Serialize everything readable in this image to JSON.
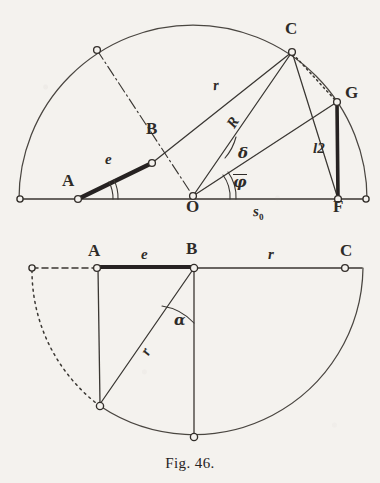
{
  "figure": {
    "caption": "Fig. 46.",
    "ink_color": "#3a3733",
    "paper_color": "#f4f2ee",
    "heavy_ink_color": "#262320"
  },
  "upper_diagram": {
    "name": "crank-slider-geometry-upper",
    "points": [
      {
        "id": "A",
        "label": "A",
        "x": 78,
        "y": 199
      },
      {
        "id": "B",
        "label": "B",
        "x": 152,
        "y": 163
      },
      {
        "id": "C",
        "label": "C",
        "x": 292,
        "y": 52
      },
      {
        "id": "O",
        "label": "O",
        "x": 193,
        "y": 196
      },
      {
        "id": "F",
        "label": "F",
        "x": 338,
        "y": 199
      },
      {
        "id": "G",
        "label": "G",
        "x": 337,
        "y": 102
      }
    ],
    "labels": [
      {
        "id": "A",
        "text": "A",
        "kind": "point",
        "x": 62,
        "y": 172
      },
      {
        "id": "B",
        "text": "B",
        "kind": "point",
        "x": 146,
        "y": 120
      },
      {
        "id": "C",
        "text": "C",
        "kind": "point",
        "x": 285,
        "y": 20
      },
      {
        "id": "O",
        "text": "O",
        "kind": "point",
        "x": 186,
        "y": 198
      },
      {
        "id": "F",
        "text": "F",
        "kind": "point",
        "x": 333,
        "y": 198
      },
      {
        "id": "G",
        "text": "G",
        "kind": "point",
        "x": 345,
        "y": 84
      },
      {
        "id": "e",
        "text": "e",
        "kind": "var",
        "x": 105,
        "y": 152
      },
      {
        "id": "r",
        "text": "r",
        "kind": "var",
        "x": 213,
        "y": 78
      },
      {
        "id": "R",
        "text": "R",
        "kind": "var",
        "x": 228,
        "y": 115
      },
      {
        "id": "l2",
        "text": "l2",
        "kind": "var",
        "x": 313,
        "y": 141
      }
    ],
    "greek_labels": [
      {
        "id": "delta",
        "text": "δ",
        "x": 238,
        "y": 146
      },
      {
        "id": "phibar",
        "text": "φ",
        "overbar": true,
        "x": 233,
        "y": 174
      }
    ],
    "sub_labels": [
      {
        "id": "s0",
        "text": "s",
        "sub": "0",
        "x": 253,
        "y": 204
      }
    ],
    "baseline": {
      "x1": 20,
      "y1": 199,
      "x2": 366,
      "y2": 199
    },
    "arc": {
      "center_x": 193,
      "center_y": 199,
      "radius": 174
    },
    "angle_arcs": [
      {
        "id": "angle-at-A",
        "vertex": "A",
        "style": "double"
      },
      {
        "id": "angle-delta",
        "vertex": "O",
        "style": "single"
      },
      {
        "id": "angle-phibar",
        "vertex": "O",
        "style": "double"
      }
    ],
    "segments": [
      {
        "id": "seg-AB",
        "from": "A",
        "to": "B",
        "style": "heavy"
      },
      {
        "id": "seg-BC",
        "from": "B",
        "to": "C",
        "style": "thin"
      },
      {
        "id": "seg-OC",
        "from": "O",
        "to": "C",
        "style": "thin"
      },
      {
        "id": "seg-OG",
        "from": "O",
        "to": "G",
        "style": "thin"
      },
      {
        "id": "seg-CG",
        "from": "C",
        "to": "G",
        "style": "dotted"
      },
      {
        "id": "seg-CF",
        "from": "C",
        "to": "F",
        "style": "thin"
      },
      {
        "id": "seg-GF",
        "from": "G",
        "to": "F",
        "style": "heavy"
      },
      {
        "id": "seg-dashdot",
        "from": "arc-upper-left",
        "to": "O",
        "style": "dash-dot"
      }
    ]
  },
  "lower_diagram": {
    "name": "crank-slider-geometry-lower",
    "points": [
      {
        "id": "A",
        "label": "A",
        "x": 97,
        "y": 268
      },
      {
        "id": "B",
        "label": "B",
        "x": 194,
        "y": 268
      },
      {
        "id": "C",
        "label": "C",
        "x": 345,
        "y": 268
      }
    ],
    "labels": [
      {
        "id": "A",
        "text": "A",
        "kind": "point",
        "x": 88,
        "y": 242
      },
      {
        "id": "B",
        "text": "B",
        "kind": "point",
        "x": 186,
        "y": 240
      },
      {
        "id": "C",
        "text": "C",
        "kind": "point",
        "x": 340,
        "y": 242
      },
      {
        "id": "e",
        "text": "e",
        "kind": "var",
        "x": 141,
        "y": 247
      },
      {
        "id": "r",
        "text": "r",
        "kind": "var",
        "x": 268,
        "y": 247
      },
      {
        "id": "rr",
        "text": "r",
        "kind": "var",
        "x": 143,
        "y": 344
      }
    ],
    "greek_labels": [
      {
        "id": "alpha",
        "text": "α",
        "x": 174,
        "y": 313
      }
    ],
    "arc": {
      "center_x": 194,
      "center_y": 268,
      "radius": 169
    },
    "angle_arcs": [
      {
        "id": "angle-alpha",
        "vertex": "B",
        "style": "single"
      }
    ],
    "segments": [
      {
        "id": "seg-AB-lower",
        "from": "A",
        "to": "B",
        "style": "heavy"
      },
      {
        "id": "seg-BC-lower",
        "from": "B",
        "to": "C",
        "style": "thin"
      },
      {
        "id": "seg-A-vert",
        "from": "A",
        "to": "A-down",
        "style": "thin"
      },
      {
        "id": "seg-B-vert",
        "from": "B",
        "to": "B-down",
        "style": "thin"
      },
      {
        "id": "seg-B-slant",
        "from": "B",
        "to": "arc-lower-left",
        "style": "thin"
      },
      {
        "id": "seg-dashed-left",
        "from": "left-end",
        "to": "A",
        "style": "dashed"
      },
      {
        "id": "seg-dotted-arc",
        "from": "left-end",
        "to": "arc-lower-left",
        "style": "dotted-arc"
      }
    ]
  }
}
